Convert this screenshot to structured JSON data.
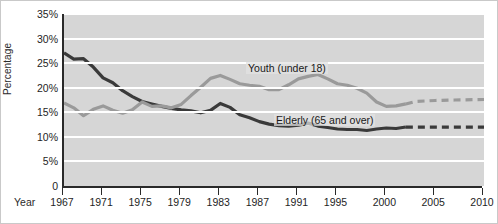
{
  "chart_data": {
    "type": "line",
    "title": "",
    "xlabel": "Year",
    "ylabel": "Percentage",
    "ylim": [
      0,
      35
    ],
    "xlim": [
      1967,
      2010
    ],
    "grid": true,
    "legend_position": "inline-annotation",
    "ytick_labels": [
      "0",
      "5%",
      "10%",
      "15%",
      "20%",
      "25%",
      "30%",
      "35%"
    ],
    "ytick_values": [
      0,
      5,
      10,
      15,
      20,
      25,
      30,
      35
    ],
    "xtick_labels": [
      "1967",
      "1971",
      "1975",
      "1979",
      "1983",
      "1987",
      "1991",
      "1995",
      "2000",
      "2005",
      "2010"
    ],
    "xtick_values": [
      1967,
      1971,
      1975,
      1979,
      1983,
      1987,
      1991,
      1995,
      2000,
      2005,
      2010
    ],
    "annotations": [
      {
        "text": "Youth (under 18)",
        "series": "Youth (under 18)"
      },
      {
        "text": "Elderly (65 and over)",
        "series": "Elderly (65 and over)"
      }
    ],
    "series": [
      {
        "name": "Elderly (65 and over)",
        "color": "#3a3a3a",
        "style": "solid-then-dashed",
        "projection_starts": 2002,
        "x": [
          1967,
          1968,
          1969,
          1970,
          1971,
          1972,
          1973,
          1974,
          1975,
          1976,
          1977,
          1978,
          1979,
          1980,
          1981,
          1982,
          1983,
          1984,
          1985,
          1986,
          1987,
          1988,
          1989,
          1990,
          1991,
          1992,
          1993,
          1994,
          1995,
          1996,
          1997,
          1998,
          1999,
          2000,
          2001,
          2002,
          2003,
          2005,
          2007,
          2010
        ],
        "y": [
          27.1,
          25.8,
          25.9,
          24.2,
          22.0,
          21.0,
          19.4,
          18.2,
          17.2,
          16.7,
          16.2,
          15.8,
          15.5,
          15.3,
          14.9,
          15.4,
          16.8,
          16.0,
          14.5,
          13.9,
          13.1,
          12.6,
          12.3,
          12.2,
          12.4,
          12.8,
          12.2,
          11.9,
          11.6,
          11.5,
          11.5,
          11.3,
          11.6,
          11.8,
          11.7,
          12.0,
          12.0,
          12.0,
          12.0,
          12.0
        ]
      },
      {
        "name": "Youth (under 18)",
        "color": "#9a9a9a",
        "style": "solid-then-dashed",
        "projection_starts": 2002,
        "x": [
          1967,
          1968,
          1969,
          1970,
          1971,
          1972,
          1973,
          1974,
          1975,
          1976,
          1977,
          1978,
          1979,
          1980,
          1981,
          1982,
          1983,
          1984,
          1985,
          1986,
          1987,
          1988,
          1989,
          1990,
          1991,
          1992,
          1993,
          1994,
          1995,
          1996,
          1997,
          1998,
          1999,
          2000,
          2001,
          2002,
          2003,
          2005,
          2007,
          2010
        ],
        "y": [
          16.9,
          15.9,
          14.3,
          15.6,
          16.3,
          15.4,
          14.8,
          15.5,
          17.1,
          16.2,
          16.3,
          15.9,
          16.6,
          18.4,
          20.1,
          21.9,
          22.5,
          21.7,
          20.8,
          20.5,
          20.3,
          19.6,
          19.6,
          20.6,
          21.8,
          22.3,
          22.7,
          21.8,
          20.8,
          20.5,
          19.9,
          18.9,
          17.1,
          16.2,
          16.3,
          16.7,
          17.2,
          17.4,
          17.5,
          17.6
        ]
      }
    ]
  },
  "axes": {
    "x_title": "Year",
    "y_title": "Percentage"
  }
}
